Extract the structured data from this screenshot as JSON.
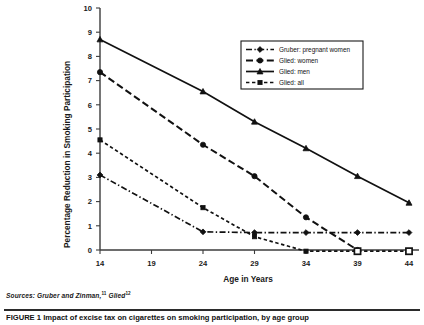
{
  "figure": {
    "sources_label": "Sources:",
    "sources_text": "Gruber and Zinman,",
    "sources_ref1": "11",
    "sources_text2": "Glied",
    "sources_ref2": "12",
    "caption_number": "FIGURE 1",
    "caption_text": "Impact of excise tax on cigarettes on smoking participation, by age group"
  },
  "chart_data": {
    "type": "line",
    "title": "",
    "xlabel": "Age in Years",
    "ylabel": "Percentage Reduction in Smoking Participation",
    "xlim": [
      14,
      44
    ],
    "ylim": [
      0,
      10
    ],
    "xticks": [
      14,
      19,
      24,
      29,
      34,
      39,
      44
    ],
    "xtick_labels": [
      "14",
      "19",
      "24",
      "29",
      "34",
      "39",
      "44"
    ],
    "yticks": [
      0,
      1,
      2,
      3,
      4,
      5,
      6,
      7,
      8,
      9,
      10
    ],
    "ytick_labels": [
      "0",
      "1",
      "2",
      "3",
      "4",
      "5",
      "6",
      "7",
      "8",
      "9",
      "10"
    ],
    "grid": false,
    "legend_position": "top-right",
    "series": [
      {
        "name": "Gruber: pregnant women",
        "marker": "diamond",
        "dash": "dash-dot",
        "color": "#111111",
        "x": [
          14,
          24,
          29,
          34,
          39,
          44
        ],
        "values": [
          3.1,
          0.75,
          0.72,
          0.72,
          0.72,
          0.72
        ]
      },
      {
        "name": "Glied: women",
        "marker": "circle",
        "dash": "long-dash",
        "color": "#111111",
        "x": [
          14,
          24,
          29,
          34,
          39
        ],
        "values": [
          7.35,
          4.35,
          3.05,
          1.35,
          0.0
        ]
      },
      {
        "name": "Glied: men",
        "marker": "triangle",
        "dash": "solid",
        "color": "#111111",
        "x": [
          14,
          24,
          29,
          34,
          39,
          44
        ],
        "values": [
          8.7,
          6.55,
          5.3,
          4.2,
          3.05,
          1.95
        ]
      },
      {
        "name": "Glied: all",
        "marker": "square",
        "dash": "short-dash",
        "color": "#111111",
        "x": [
          14,
          24,
          29,
          34,
          39,
          44
        ],
        "values": [
          4.55,
          1.75,
          0.55,
          -0.05,
          -0.05,
          -0.05
        ]
      }
    ]
  },
  "legend": {
    "items": [
      {
        "label": "Gruber: pregnant women"
      },
      {
        "label": "Glied: women"
      },
      {
        "label": "Glied: men"
      },
      {
        "label": "Glied: all"
      }
    ]
  }
}
